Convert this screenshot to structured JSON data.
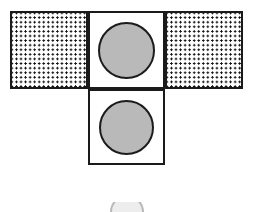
{
  "figure": {
    "title": "",
    "type": "geometric-net-diagram",
    "canvas": {
      "width": 254,
      "height": 212,
      "background_color": "#ffffff"
    },
    "style": {
      "outline_color": "#1a1a1a",
      "outline_width_px": 2.2,
      "dot_color": "#111111",
      "circle_fill_color": "#b9b9b9",
      "circle_outline_color": "#1c1c1c",
      "ghost_color": "#c8c8c8"
    },
    "cells": [
      {
        "id": "top-left",
        "fill": "dotted",
        "x": 10,
        "y": 11,
        "width": 78,
        "height": 78,
        "dot_columns": 13,
        "dot_rows": 9
      },
      {
        "id": "top-center",
        "fill": "circle",
        "x": 88,
        "y": 11,
        "width": 77,
        "height": 78
      },
      {
        "id": "top-right",
        "fill": "dotted",
        "x": 165,
        "y": 11,
        "width": 78,
        "height": 78,
        "dot_columns": 13,
        "dot_rows": 9
      },
      {
        "id": "bottom-center",
        "fill": "circle",
        "x": 88,
        "y": 89,
        "width": 77,
        "height": 76
      }
    ],
    "circles": [
      {
        "id": "circle-top-center",
        "cx": 126,
        "cy": 50,
        "diameter": 57,
        "fill": "stipple-gray"
      },
      {
        "id": "circle-bottom-center",
        "cx": 126,
        "cy": 127,
        "diameter": 55,
        "fill": "stipple-gray"
      }
    ],
    "ghost": {
      "id": "partial-circle-bottom-edge",
      "cx": 127,
      "cy": 212,
      "diameter": 34,
      "visible_height": 10
    }
  }
}
